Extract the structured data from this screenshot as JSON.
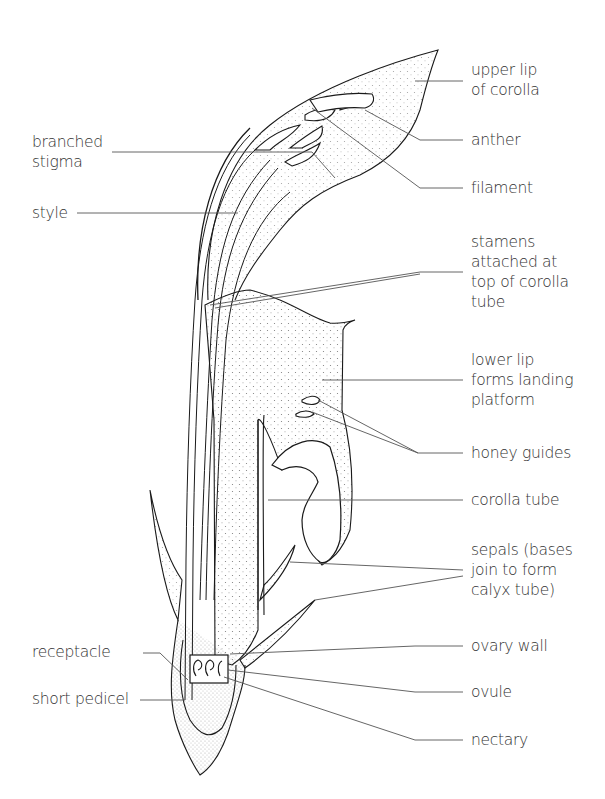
{
  "figure": {
    "labels_left": [
      {
        "id": "branched-stigma",
        "lines": [
          "branched",
          "stigma"
        ]
      },
      {
        "id": "style",
        "lines": [
          "style"
        ]
      },
      {
        "id": "receptacle",
        "lines": [
          "receptacle"
        ]
      },
      {
        "id": "short-pedicel",
        "lines": [
          "short pedicel"
        ]
      }
    ],
    "labels_right": [
      {
        "id": "upper-lip",
        "lines": [
          "upper lip",
          "of corolla"
        ]
      },
      {
        "id": "anther",
        "lines": [
          "anther"
        ]
      },
      {
        "id": "filament",
        "lines": [
          "filament"
        ]
      },
      {
        "id": "stamens",
        "lines": [
          "stamens",
          "attached at",
          "top of corolla",
          "tube"
        ]
      },
      {
        "id": "lower-lip",
        "lines": [
          "lower lip",
          "forms landing",
          "platform"
        ]
      },
      {
        "id": "honey-guides",
        "lines": [
          "honey guides"
        ]
      },
      {
        "id": "corolla-tube",
        "lines": [
          "corolla tube"
        ]
      },
      {
        "id": "sepals",
        "lines": [
          "sepals (bases",
          "join to form",
          "calyx tube)"
        ]
      },
      {
        "id": "ovary-wall",
        "lines": [
          "ovary wall"
        ]
      },
      {
        "id": "ovule",
        "lines": [
          "ovule"
        ]
      },
      {
        "id": "nectary",
        "lines": [
          "nectary"
        ]
      }
    ]
  },
  "colors": {
    "ink": "#1a1a1a",
    "leader": "#555555",
    "background": "#ffffff"
  }
}
